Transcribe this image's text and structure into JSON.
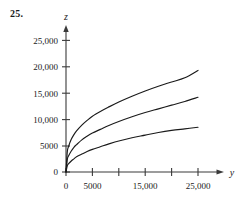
{
  "figure": {
    "exercise_number": "25.",
    "axis_labels": {
      "x": "y",
      "y": "z"
    }
  },
  "chart_data": {
    "type": "line",
    "title": "",
    "xlabel": "y",
    "ylabel": "z",
    "xlim": [
      0,
      27500
    ],
    "ylim": [
      0,
      26500
    ],
    "grid": false,
    "legend": "none",
    "x_ticks": [
      0,
      5000,
      10000,
      15000,
      20000,
      25000
    ],
    "x_tick_labels": [
      "0",
      "5000",
      "",
      "15,000",
      "",
      "25,000"
    ],
    "y_ticks": [
      0,
      5000,
      10000,
      15000,
      20000,
      25000
    ],
    "y_tick_labels": [
      "0",
      "5000",
      "10,000",
      "15,000",
      "20,000",
      "25,000"
    ],
    "x": [
      0,
      250,
      500,
      1000,
      1500,
      2000,
      3000,
      4000,
      5000,
      6500,
      8000,
      10000,
      12500,
      15000,
      17500,
      20000,
      22500,
      25000
    ],
    "series": [
      {
        "name": "upper-curve",
        "values": [
          0,
          3900,
          4900,
          6200,
          7100,
          7800,
          8900,
          9800,
          10600,
          11500,
          12300,
          13300,
          14400,
          15400,
          16300,
          17100,
          17900,
          19300
        ]
      },
      {
        "name": "middle-curve",
        "values": [
          0,
          2400,
          3100,
          4000,
          4700,
          5200,
          6100,
          6800,
          7400,
          8100,
          8800,
          9600,
          10500,
          11300,
          12000,
          12700,
          13400,
          14200
        ]
      },
      {
        "name": "lower-curve",
        "values": [
          0,
          1200,
          1600,
          2100,
          2500,
          2900,
          3400,
          3900,
          4300,
          4800,
          5300,
          5900,
          6500,
          7000,
          7500,
          7900,
          8200,
          8500
        ]
      }
    ]
  }
}
